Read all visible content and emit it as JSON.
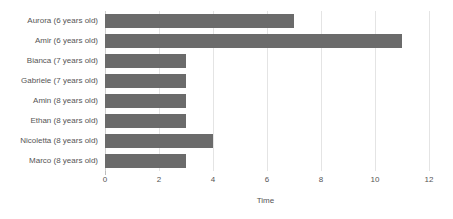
{
  "chart_data": {
    "type": "bar",
    "orientation": "horizontal",
    "title": "",
    "xlabel": "Time",
    "ylabel": "",
    "categories": [
      "Aurora (6 years old)",
      "Amir (6 years old)",
      "Bianca (7 years old)",
      "Gabriele (7 years old)",
      "Amin (8 years old)",
      "Ethan (8 years old)",
      "Nicoletta (8 years old)",
      "Marco (8 years old)"
    ],
    "values": [
      7,
      11,
      3,
      3,
      3,
      3,
      4,
      3
    ],
    "xlim": [
      0,
      12
    ],
    "xticks": [
      0,
      2,
      4,
      6,
      8,
      10,
      12
    ],
    "xtick_labels": [
      "0",
      "2",
      "4",
      "6",
      "8",
      "10",
      "12"
    ],
    "grid": "vertical",
    "legend": null,
    "bar_color": "#6b6b6b",
    "gridline_color": "#e4e4e4",
    "text_color": "#555555",
    "background_color": "#ffffff"
  }
}
